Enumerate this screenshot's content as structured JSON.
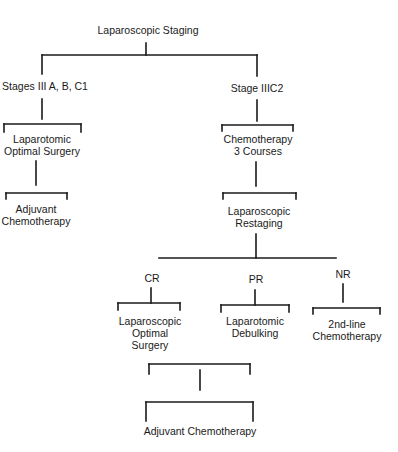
{
  "diagram": {
    "type": "flowchart",
    "nodes": {
      "root": "Laparoscopic Staging",
      "left_stage": "Stages III A, B, C1",
      "right_stage": "Stage IIIC2",
      "left_surgery_1": "Laparotomic",
      "left_surgery_2": "Optimal Surgery",
      "left_adjuvant_1": "Adjuvant",
      "left_adjuvant_2": "Chemotherapy",
      "chemo_1": "Chemotherapy",
      "chemo_2": "3 Courses",
      "restaging_1": "Laparoscopic",
      "restaging_2": "Restaging",
      "cr": "CR",
      "pr": "PR",
      "nr": "NR",
      "cr_surgery_1": "Laparoscopic",
      "cr_surgery_2": "Optimal",
      "cr_surgery_3": "Surgery",
      "pr_surgery_1": "Laparotomic",
      "pr_surgery_2": "Debulking",
      "nr_chemo_1": "2nd-line",
      "nr_chemo_2": "Chemotherapy",
      "final": "Adjuvant Chemotherapy"
    },
    "edges": [
      [
        "Laparoscopic Staging",
        "Stages III A, B, C1"
      ],
      [
        "Laparoscopic Staging",
        "Stage IIIC2"
      ],
      [
        "Stages III A, B, C1",
        "Laparotomic Optimal Surgery"
      ],
      [
        "Laparotomic Optimal Surgery",
        "Adjuvant Chemotherapy"
      ],
      [
        "Stage IIIC2",
        "Chemotherapy 3 Courses"
      ],
      [
        "Chemotherapy 3 Courses",
        "Laparoscopic Restaging"
      ],
      [
        "Laparoscopic Restaging",
        "CR"
      ],
      [
        "Laparoscopic Restaging",
        "PR"
      ],
      [
        "Laparoscopic Restaging",
        "NR"
      ],
      [
        "CR",
        "Laparoscopic Optimal Surgery"
      ],
      [
        "PR",
        "Laparotomic Debulking"
      ],
      [
        "NR",
        "2nd-line Chemotherapy"
      ],
      [
        "Laparoscopic Optimal Surgery",
        "Adjuvant Chemotherapy (final)"
      ],
      [
        "Laparotomic Debulking",
        "Adjuvant Chemotherapy (final)"
      ]
    ]
  }
}
